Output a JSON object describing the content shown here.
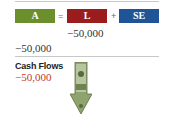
{
  "equation": {
    "assets": {
      "label": "A",
      "color": "#6a8f2c"
    },
    "equals": "=",
    "liabilities": {
      "label": "L",
      "color": "#9b1c1c"
    },
    "plus": "+",
    "equity": {
      "label": "SE",
      "color": "#1f5596"
    }
  },
  "entries": {
    "liabilities_change": "−50,000",
    "assets_change": "−50,000"
  },
  "cash_flows": {
    "title": "Cash Flows",
    "value": "−50,000",
    "value_color": "#c0392b",
    "icon": "money-arrow-down-icon"
  }
}
